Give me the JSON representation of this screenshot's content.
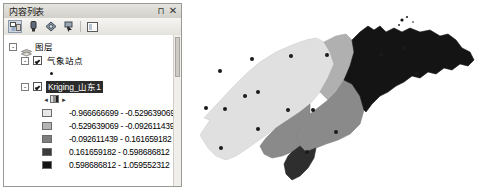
{
  "panel": {
    "title": "内容列表",
    "pin_icon": "pin-icon",
    "close_icon": "close-icon",
    "pin_label": "⊓",
    "close_label": "✕",
    "toolbar": [
      {
        "name": "list-by-drawing-order-icon",
        "active": true
      },
      {
        "name": "list-by-source-icon",
        "active": false
      },
      {
        "name": "list-by-visibility-icon",
        "active": false
      },
      {
        "name": "list-by-selection-icon",
        "active": false
      },
      {
        "name": "options-icon",
        "active": false
      }
    ]
  },
  "tree": {
    "root": {
      "label": "图层",
      "expander": "-"
    },
    "layers": [
      {
        "label": "气象站点",
        "expander": "-",
        "checked": true,
        "symbol": "point-dot"
      },
      {
        "label": "Kriging_山东1",
        "expander": "-",
        "checked": true,
        "selected": true,
        "symbol": "raster-ramp"
      }
    ],
    "legend": {
      "classes": [
        {
          "range": "-0.966666699 - -0.529639069",
          "color": "#e8e8e8"
        },
        {
          "range": "-0.529639069 - -0.092611439",
          "color": "#b4b4b4"
        },
        {
          "range": "-0.092611439 - 0.161659182",
          "color": "#7d7d7d"
        },
        {
          "range": "0.161659182 - 0.598686812",
          "color": "#3c3c3c"
        },
        {
          "range": "0.598686812 - 1.059552312",
          "color": "#141414"
        }
      ]
    }
  },
  "map": {
    "name": "kriging-interpolation-map",
    "background": "#ffffff",
    "station_color": "#1a1a1a",
    "zones": [
      {
        "class": 0,
        "color": "#e0e0e0"
      },
      {
        "class": 1,
        "color": "#b0b0b0"
      },
      {
        "class": 2,
        "color": "#8a8a8a"
      },
      {
        "class": 3,
        "color": "#4a4a4a"
      },
      {
        "class": 4,
        "color": "#141414"
      }
    ],
    "stations": [
      {
        "x": 32,
        "y": 71
      },
      {
        "x": 64,
        "y": 59
      },
      {
        "x": 103,
        "y": 56
      },
      {
        "x": 139,
        "y": 55
      },
      {
        "x": 18,
        "y": 108
      },
      {
        "x": 37,
        "y": 109
      },
      {
        "x": 57,
        "y": 96
      },
      {
        "x": 70,
        "y": 92
      },
      {
        "x": 100,
        "y": 110
      },
      {
        "x": 125,
        "y": 110
      },
      {
        "x": 70,
        "y": 129
      },
      {
        "x": 148,
        "y": 132
      },
      {
        "x": 33,
        "y": 148
      },
      {
        "x": 119,
        "y": 152
      },
      {
        "x": 193,
        "y": 55
      },
      {
        "x": 216,
        "y": 48
      },
      {
        "x": 229,
        "y": 73
      }
    ]
  }
}
